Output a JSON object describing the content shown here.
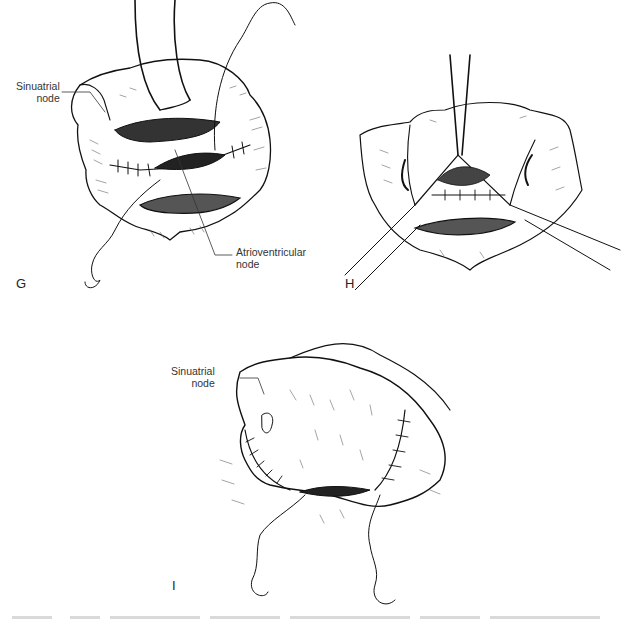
{
  "figure": {
    "panels": [
      {
        "letter": "G",
        "labels": [
          {
            "id": "sa-node-g",
            "line1": "Sinuatrial",
            "line2": "node"
          },
          {
            "id": "av-node-g",
            "line1": "Atrioventricular",
            "line2": "node"
          }
        ]
      },
      {
        "letter": "H",
        "labels": []
      },
      {
        "letter": "I",
        "labels": [
          {
            "id": "sa-node-i",
            "line1": "Sinuatrial",
            "line2": "node"
          }
        ]
      }
    ],
    "caption_cropped": true
  }
}
